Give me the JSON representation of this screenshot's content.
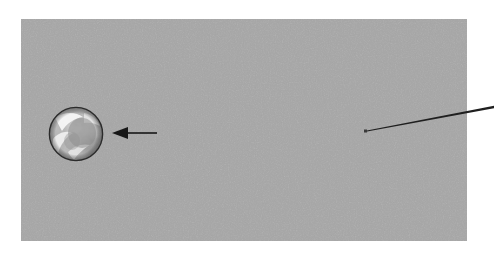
{
  "figure": {
    "canvas": {
      "width": 495,
      "height": 257,
      "background_color": "#ffffff"
    },
    "panel": {
      "label": "image-frame",
      "x": 21,
      "y": 19,
      "width": 446,
      "height": 222,
      "fill_color": "#a9a9a9",
      "texture": "halftone-dither-noise",
      "border": "none"
    },
    "objects": [
      {
        "id": "primary-body",
        "name": "large-sphere",
        "shape": "circle",
        "center_x": 76,
        "center_y": 134,
        "radius": 27,
        "outline_color": "#2b2b2b",
        "outline_width": 1.4,
        "body_color": "#b9b9b9",
        "highlight_color": "#f2f2f2",
        "shadow_color": "#8d8d8d",
        "description": "bright mottled sphere with swirling cloud-like light and dark patches"
      },
      {
        "id": "secondary-body",
        "name": "small-point-source",
        "shape": "dot",
        "center_x": 365.5,
        "center_y": 131,
        "size": 3,
        "color": "#3a3a3a",
        "description": "tiny dark point marking a faint companion object"
      }
    ],
    "annotations": [
      {
        "id": "annotation-arrow",
        "name": "left-pointing-arrow",
        "type": "arrow",
        "tail_x": 157,
        "tail_y": 133,
        "head_x": 112,
        "head_y": 133,
        "direction": "left",
        "color": "#171717",
        "shaft_width": 1.6,
        "head_length": 16,
        "head_half_width": 6,
        "points_to": "primary-body"
      },
      {
        "id": "annotation-leader",
        "name": "leader-line",
        "type": "line",
        "start_x": 367,
        "start_y": 131,
        "end_x": 494,
        "end_y": 107,
        "color": "#1f1f1f",
        "start_width": 0.9,
        "end_width": 2.6,
        "extends_beyond_panel": true,
        "points_to": "secondary-body"
      }
    ]
  }
}
